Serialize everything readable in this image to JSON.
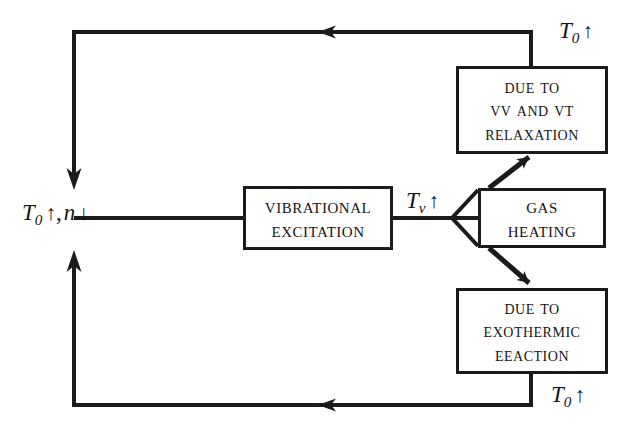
{
  "diagram": {
    "ink_color": "#1b1b1b",
    "background": "#ffffff",
    "nodes": [
      {
        "id": "vibrational-excitation",
        "lines": [
          "Vibrational",
          "Excitation"
        ]
      },
      {
        "id": "gas-heating",
        "lines": [
          "Gas",
          "Heating"
        ]
      },
      {
        "id": "vv-vt-relaxation",
        "lines": [
          "Due to",
          "VV and VT",
          "Relaxation"
        ]
      },
      {
        "id": "exothermic-reaction",
        "lines": [
          "Due to",
          "Exothermic",
          "Eeaction"
        ]
      }
    ],
    "labels": [
      {
        "id": "label-tv-up",
        "symbol": "T",
        "sub": "v",
        "comma": "",
        "symbol2": "",
        "sub2": "",
        "arrow": "↑",
        "arrow2": ""
      },
      {
        "id": "label-t0-up-top",
        "symbol": "T",
        "sub": "0",
        "comma": "",
        "symbol2": "",
        "sub2": "",
        "arrow": "↑",
        "arrow2": ""
      },
      {
        "id": "label-t0-up-bottom",
        "symbol": "T",
        "sub": "0",
        "comma": "",
        "symbol2": "",
        "sub2": "",
        "arrow": "↑",
        "arrow2": ""
      },
      {
        "id": "label-t0-up-n-down",
        "symbol": "T",
        "sub": "0",
        "comma": ",",
        "symbol2": "n",
        "sub2": "",
        "arrow": "↑",
        "arrow2": "↓"
      }
    ]
  }
}
